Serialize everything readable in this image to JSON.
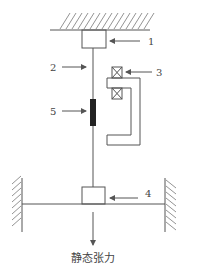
{
  "diagram": {
    "type": "static-tension-test-setup",
    "labels": {
      "part1": "1",
      "part2": "2",
      "part3": "3",
      "part4": "4",
      "part5": "5"
    },
    "caption": "静态张力",
    "colors": {
      "line": "#555555",
      "element5_fill": "#222222"
    }
  }
}
